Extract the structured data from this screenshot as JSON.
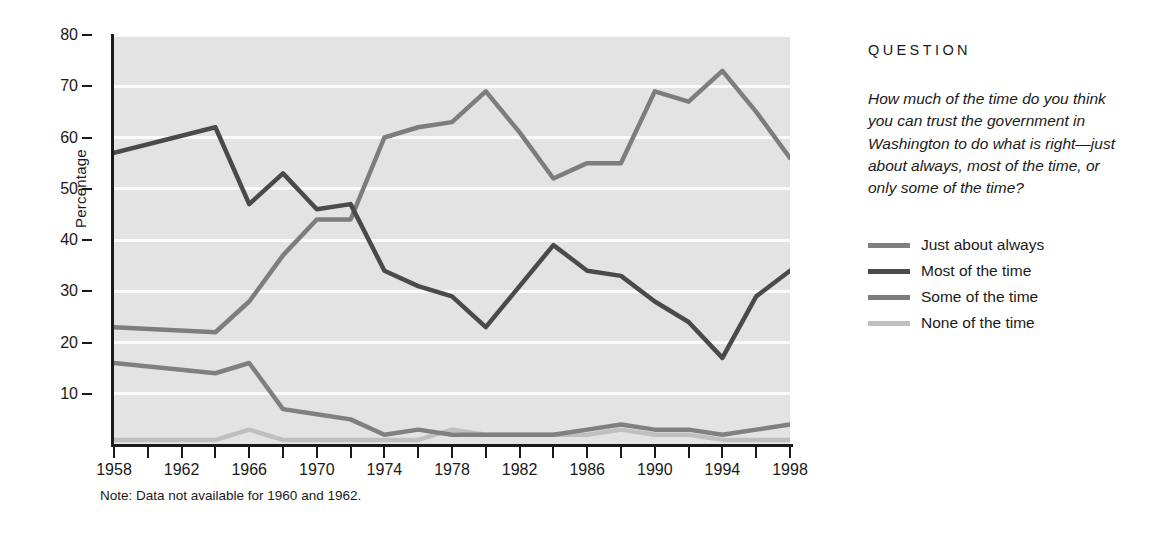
{
  "side": {
    "question_heading": "QUESTION",
    "question_text": "How much of the time do you think you can trust the government in Washington to do what is right—just about always, most of the time, or only some of the time?"
  },
  "note": "Note:  Data not available for 1960 and 1962.",
  "chart_data": {
    "type": "line",
    "title": "",
    "xlabel": "",
    "ylabel": "Percentage",
    "xlim": [
      1958,
      1998
    ],
    "ylim": [
      0,
      80
    ],
    "yticks": [
      10,
      20,
      30,
      40,
      50,
      60,
      70,
      80
    ],
    "xticks": [
      1958,
      1962,
      1966,
      1970,
      1974,
      1978,
      1982,
      1986,
      1990,
      1994,
      1998
    ],
    "minor_xticks": [
      1960,
      1964,
      1968,
      1972,
      1976,
      1980,
      1984,
      1988,
      1992,
      1996
    ],
    "grid": "horizontal",
    "legend_position": "right",
    "plot_background": "#e3e3e3",
    "x": [
      1958,
      1964,
      1966,
      1968,
      1970,
      1972,
      1974,
      1976,
      1978,
      1980,
      1982,
      1984,
      1986,
      1988,
      1990,
      1992,
      1994,
      1996,
      1998
    ],
    "series": [
      {
        "name": "Just about always",
        "color": "#808080",
        "values": [
          16,
          14,
          16,
          7,
          6,
          5,
          2,
          3,
          2,
          2,
          2,
          2,
          3,
          4,
          3,
          3,
          2,
          3,
          4
        ]
      },
      {
        "name": "Most of the time",
        "color": "#4a4a4a",
        "values": [
          57,
          62,
          47,
          53,
          46,
          47,
          34,
          31,
          29,
          23,
          31,
          39,
          34,
          33,
          28,
          24,
          17,
          29,
          34
        ]
      },
      {
        "name": "Some of the time",
        "color": "#7d7d7d",
        "values": [
          23,
          22,
          28,
          37,
          44,
          44,
          60,
          62,
          63,
          69,
          61,
          52,
          55,
          55,
          69,
          67,
          73,
          65,
          56
        ]
      },
      {
        "name": "None of the time",
        "color": "#bfbfbf",
        "values": [
          1,
          1,
          3,
          1,
          1,
          1,
          1,
          1,
          3,
          2,
          2,
          2,
          2,
          3,
          2,
          2,
          1,
          1,
          1
        ]
      }
    ]
  }
}
